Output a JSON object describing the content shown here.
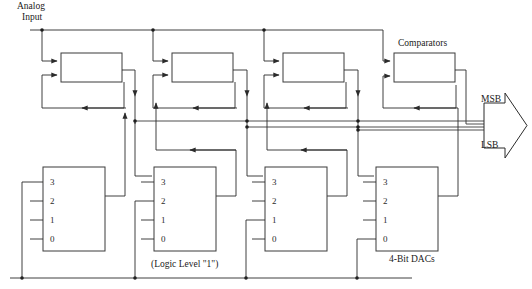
{
  "diagram": {
    "canvas": {
      "width": 532,
      "height": 289
    },
    "labels": {
      "analog_input_line1": "Analog",
      "analog_input_line2": "Input",
      "comparators": "Comparators",
      "msb": "MSB",
      "lsb": "LSB",
      "logic_level": "(Logic Level \"1\")",
      "dacs": "4-Bit DACs"
    },
    "comparator_stages": [
      {
        "id": "comparator-1",
        "x": 61,
        "y": 53,
        "w": 61,
        "h": 29
      },
      {
        "id": "comparator-2",
        "x": 172,
        "y": 53,
        "w": 61,
        "h": 29
      },
      {
        "id": "comparator-3",
        "x": 283,
        "y": 53,
        "w": 61,
        "h": 29
      },
      {
        "id": "comparator-4",
        "x": 394,
        "y": 53,
        "w": 61,
        "h": 29
      }
    ],
    "dac_blocks": [
      {
        "id": "dac-1",
        "x": 43,
        "y": 167,
        "w": 62,
        "h": 84,
        "pins": [
          "3",
          "2",
          "1",
          "0"
        ]
      },
      {
        "id": "dac-2",
        "x": 154,
        "y": 167,
        "w": 62,
        "h": 84,
        "pins": [
          "3",
          "2",
          "1",
          "0"
        ]
      },
      {
        "id": "dac-3",
        "x": 265,
        "y": 167,
        "w": 62,
        "h": 84,
        "pins": [
          "3",
          "2",
          "1",
          "0"
        ]
      },
      {
        "id": "dac-4",
        "x": 376,
        "y": 167,
        "w": 62,
        "h": 84,
        "pins": [
          "3",
          "2",
          "1",
          "0"
        ]
      }
    ],
    "output_bus": {
      "bit_count": 4,
      "top_label": "MSB",
      "bottom_label": "LSB"
    },
    "colors": {
      "wire": "#2b2b2b",
      "block_stroke": "#3b3b3b",
      "background": "#ffffff",
      "text": "#1a1a1a"
    }
  }
}
